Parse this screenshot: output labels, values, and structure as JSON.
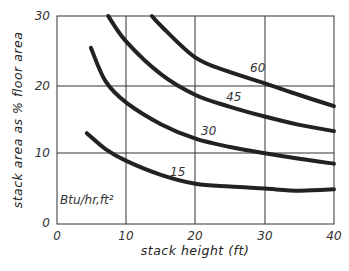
{
  "chart_data": {
    "type": "line",
    "title": "",
    "xlabel": "stack height (ft)",
    "ylabel": "stack area as % floor area",
    "xlim": [
      0,
      40
    ],
    "ylim": [
      0,
      30
    ],
    "xticks": [
      0,
      10,
      20,
      30,
      40
    ],
    "yticks": [
      0,
      10,
      20,
      30
    ],
    "grid": true,
    "legend_title": "Btu/hr,ft²",
    "series": [
      {
        "name": "15",
        "x": [
          4.3,
          7,
          10,
          15,
          20,
          25,
          30,
          35,
          40
        ],
        "values": [
          13.1,
          10.8,
          9.1,
          7.1,
          5.8,
          5.4,
          5.1,
          4.8,
          5.0
        ]
      },
      {
        "name": "30",
        "x": [
          4.9,
          7,
          10,
          15,
          20,
          25,
          30,
          35,
          40
        ],
        "values": [
          25.4,
          20.6,
          17.5,
          14.4,
          12.3,
          11.1,
          10.2,
          9.4,
          8.7
        ]
      },
      {
        "name": "45",
        "x": [
          7.4,
          10,
          15,
          20,
          25,
          30,
          35,
          40
        ],
        "values": [
          30.0,
          26.3,
          21.6,
          18.6,
          16.9,
          15.5,
          14.3,
          13.4
        ]
      },
      {
        "name": "60",
        "x": [
          13.7,
          15,
          20,
          25,
          30,
          35,
          40
        ],
        "values": [
          30.0,
          28.6,
          24.0,
          21.9,
          20.3,
          18.6,
          17.0
        ]
      }
    ]
  },
  "labels": {
    "curve_15": "15",
    "curve_30": "30",
    "curve_45": "45",
    "curve_60": "60",
    "units": "Btu/hr,ft²",
    "xlabel": "stack height (ft)",
    "ylabel": "stack area as % floor area",
    "x0": "0",
    "x10": "10",
    "x20": "20",
    "x30": "30",
    "x40": "40",
    "y0": "0",
    "y10": "10",
    "y20": "20",
    "y30": "30"
  }
}
